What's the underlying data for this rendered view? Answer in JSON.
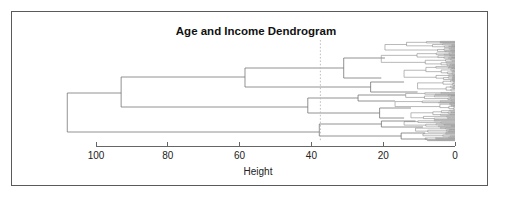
{
  "figure": {
    "title": "Age and Income Dendrogram",
    "width": 508,
    "height": 201,
    "frame_color": "#5a5a5a",
    "background": "#ffffff"
  },
  "axis": {
    "label": "Height",
    "tick_labels": [
      "100",
      "80",
      "60",
      "40",
      "20",
      "0"
    ],
    "tick_values": [
      100,
      80,
      60,
      40,
      20,
      0
    ],
    "line_color": "#555555"
  },
  "cut": {
    "height": 37.5,
    "color": "#b9b9b9",
    "style": "dashed"
  },
  "chart_data": {
    "type": "dendrogram",
    "title": "Age and Income Dendrogram",
    "xlabel": "Height",
    "ylabel": "",
    "orientation": "horizontal-right-to-left",
    "xlim": [
      108,
      0
    ],
    "grid": false,
    "legend": null,
    "annotations": [
      {
        "kind": "cut-line",
        "axis": "x",
        "value": 37.5,
        "style": "dashed",
        "color": "#b9b9b9"
      }
    ],
    "axis_ticks": [
      100,
      80,
      60,
      40,
      20,
      0
    ],
    "leaf_count": 180,
    "line_color": "#8a8a8a",
    "merges": [
      {
        "id": "root",
        "height": 108.0,
        "children": [
          "n1",
          "cC"
        ]
      },
      {
        "id": "n1",
        "height": 93.0,
        "children": [
          "n2",
          "n5"
        ]
      },
      {
        "id": "n2",
        "height": 58.5,
        "children": [
          "cA1",
          "cA2"
        ]
      },
      {
        "id": "n5",
        "height": 41.0,
        "children": [
          "cB1",
          "cB2"
        ]
      },
      {
        "id": "cC",
        "height": 37.8,
        "children": [
          "cC1",
          "cC2"
        ]
      },
      {
        "id": "cA1",
        "height": 31.0,
        "children": [
          "leafset-1",
          "leafset-2"
        ]
      },
      {
        "id": "cA2",
        "height": 23.5,
        "children": [
          "leafset-3",
          "leafset-4"
        ]
      },
      {
        "id": "cB1",
        "height": 27.0,
        "children": [
          "leafset-5",
          "leafset-6"
        ]
      },
      {
        "id": "cB2",
        "height": 21.0,
        "children": [
          "leafset-7",
          "leafset-8"
        ]
      },
      {
        "id": "cC1",
        "height": 20.5,
        "children": [
          "leafset-9",
          "leafset-10"
        ]
      },
      {
        "id": "cC2",
        "height": 15.0,
        "children": [
          "leafset-11",
          "leafset-12"
        ]
      }
    ]
  }
}
